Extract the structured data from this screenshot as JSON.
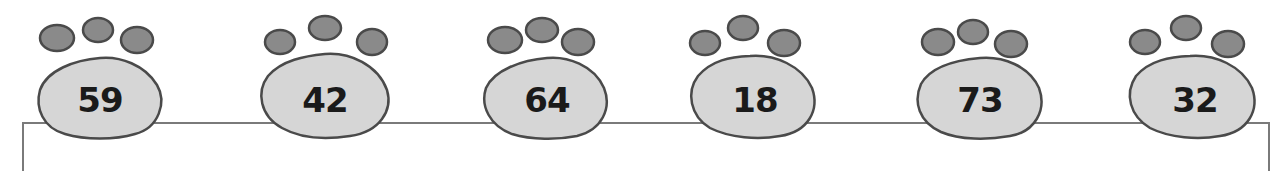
{
  "paws": [
    {
      "number": "59"
    },
    {
      "number": "42"
    },
    {
      "number": "64"
    },
    {
      "number": "18"
    },
    {
      "number": "73"
    },
    {
      "number": "32"
    }
  ],
  "colors": {
    "pad_fill": "#d6d6d6",
    "toe_fill": "#8a8a8a",
    "outline": "#4a4a4a",
    "box_border": "#7a7a7a"
  }
}
